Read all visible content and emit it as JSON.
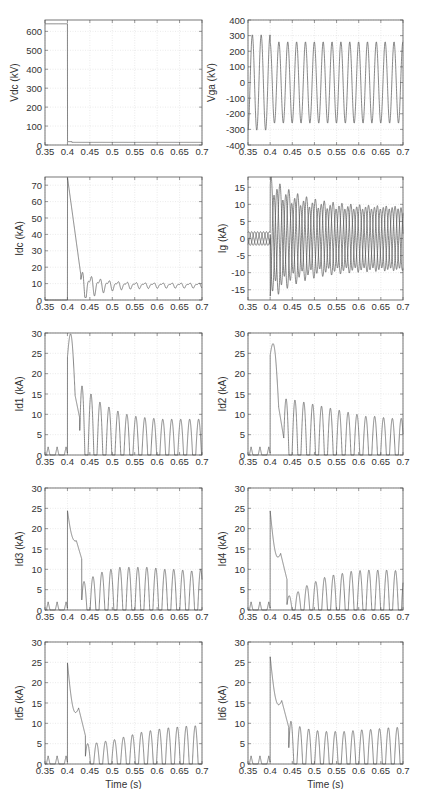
{
  "figure": {
    "layout": "5 rows x 2 columns",
    "xaxis_label": "Time (s)",
    "xticks": [
      "0.35",
      "0.4",
      "0.45",
      "0.5",
      "0.55",
      "0.6",
      "0.65",
      "0.7"
    ],
    "line_color": "#555555",
    "grid_color": "#dddddd"
  },
  "chart_data": [
    {
      "id": "vdc",
      "type": "line",
      "ylabel": "Vdc (kV)",
      "xlim": [
        0.35,
        0.7
      ],
      "ylim": [
        0,
        660
      ],
      "yticks": [
        0,
        100,
        200,
        300,
        400,
        500,
        600
      ],
      "xlabel": "",
      "description": "DC voltage ~640 kV until fault at t=0.4 s, then drops to ~15 kV and stays flat",
      "series": [
        {
          "name": "Vdc",
          "x": [
            0.35,
            0.399,
            0.4,
            0.41,
            0.7
          ],
          "y": [
            640,
            640,
            15,
            15,
            12
          ]
        }
      ]
    },
    {
      "id": "vga",
      "type": "line",
      "ylabel": "Vga (kV)",
      "xlim": [
        0.35,
        0.7
      ],
      "ylim": [
        -400,
        400
      ],
      "yticks": [
        -400,
        -300,
        -200,
        -100,
        0,
        100,
        200,
        300,
        400
      ],
      "xlabel": "",
      "description": "AC phase-a voltage, 50 Hz sinusoid ~±300 kV before 0.4 s, ~±260 kV after",
      "series": [
        {
          "name": "Vga",
          "freq_hz": 50,
          "amp_before": 305,
          "amp_after": 260
        }
      ]
    },
    {
      "id": "idc",
      "type": "line",
      "ylabel": "Idc (kA)",
      "xlim": [
        0.35,
        0.7
      ],
      "ylim": [
        0,
        75
      ],
      "yticks": [
        0,
        10,
        20,
        30,
        40,
        50,
        60,
        70
      ],
      "xlabel": "",
      "description": "DC current ~0 before fault; spikes to ~75 kA at 0.4 s, decays to ~15 kA by 0.43 s, then oscillates settling ~9 kA",
      "series": [
        {
          "name": "Idc",
          "x": [
            0.35,
            0.4,
            0.401,
            0.43,
            0.44,
            0.445,
            0.45,
            0.455,
            0.46,
            0.465,
            0.47,
            0.48,
            0.5,
            0.55,
            0.6,
            0.65,
            0.7
          ],
          "y": [
            0,
            0,
            75,
            14,
            17,
            2,
            16,
            9,
            14,
            2,
            13,
            4,
            8,
            10,
            9,
            9,
            9
          ]
        }
      ]
    },
    {
      "id": "ig",
      "type": "line",
      "ylabel": "Ig (kA)",
      "xlim": [
        0.35,
        0.7
      ],
      "ylim": [
        -18,
        18
      ],
      "yticks": [
        -15,
        -10,
        -5,
        0,
        5,
        10,
        15
      ],
      "xlabel": "",
      "description": "Three-phase grid currents ~±2 kA before 0.4 s; after fault peaks ~±16 kA decaying to ~±9 kA with DC offsets",
      "series": [
        {
          "name": "Ig (3 phases)",
          "amp_before": 2,
          "peak_after": 16.5,
          "steady_after": 9
        }
      ]
    },
    {
      "id": "id1",
      "type": "line",
      "ylabel": "Id1 (kA)",
      "xlim": [
        0.35,
        0.7
      ],
      "ylim": [
        0,
        30
      ],
      "yticks": [
        0,
        5,
        10,
        15,
        20,
        25,
        30
      ],
      "xlabel": "",
      "series": [
        {
          "name": "Id1",
          "pre_peaks": 2,
          "jump": 24,
          "peak": 26.5,
          "dip": 9,
          "pulse_peaks": [
            17,
            15,
            13,
            11.8,
            10.8,
            10,
            9.5,
            9.2,
            9,
            8.8,
            8.8,
            8.8,
            8.8,
            8.8
          ]
        }
      ]
    },
    {
      "id": "id2",
      "type": "line",
      "ylabel": "Id2 (kA)",
      "xlim": [
        0.35,
        0.7
      ],
      "ylim": [
        0,
        30
      ],
      "yticks": [
        0,
        5,
        10,
        15,
        20,
        25,
        30
      ],
      "xlabel": "",
      "series": [
        {
          "name": "Id2",
          "pre_peaks": 2,
          "jump": 24.5,
          "peak": 22.5,
          "dip": 4,
          "pulse_peaks": [
            13.8,
            13.5,
            13,
            12.5,
            12,
            11.5,
            11,
            10.5,
            10,
            9.5,
            9.5,
            9.2,
            9,
            9
          ]
        }
      ]
    },
    {
      "id": "id3",
      "type": "line",
      "ylabel": "Id3 (kA)",
      "xlim": [
        0.35,
        0.7
      ],
      "ylim": [
        0,
        30
      ],
      "yticks": [
        0,
        5,
        10,
        15,
        20,
        25,
        30
      ],
      "xlabel": "",
      "series": [
        {
          "name": "Id3",
          "pre_peaks": 2,
          "jump": 24.5,
          "peak": 16,
          "dip": 12.5,
          "pulse_peaks": [
            7,
            8.2,
            9.3,
            10,
            10.5,
            10.5,
            10.5,
            10.5,
            10.3,
            10,
            10,
            9.8,
            9.6,
            10
          ]
        }
      ]
    },
    {
      "id": "id4",
      "type": "line",
      "ylabel": "Id4 (kA)",
      "xlim": [
        0.35,
        0.7
      ],
      "ylim": [
        0,
        30
      ],
      "yticks": [
        0,
        5,
        10,
        15,
        20,
        25,
        30
      ],
      "xlabel": "",
      "series": [
        {
          "name": "Id4",
          "pre_peaks": 2,
          "jump": 24.5,
          "peak": 11,
          "dip": 7.5,
          "pulse_peaks": [
            3.5,
            4.5,
            6,
            7,
            8,
            8.6,
            9,
            9.5,
            9.7,
            9.8,
            9.8,
            9.8,
            9.7,
            9
          ]
        }
      ]
    },
    {
      "id": "id5",
      "type": "line",
      "ylabel": "Id5 (kA)",
      "xlim": [
        0.35,
        0.7
      ],
      "ylim": [
        0,
        30
      ],
      "yticks": [
        0,
        5,
        10,
        15,
        20,
        25,
        30
      ],
      "xlabel": "Time (s)",
      "series": [
        {
          "name": "Id5",
          "pre_peaks": 2,
          "jump": 25,
          "peak": 10.5,
          "dip": 7,
          "pulse_peaks": [
            5,
            5.2,
            5.6,
            6,
            6.6,
            7.2,
            7.8,
            8.2,
            8.6,
            8.9,
            9.1,
            9.3,
            9.4
          ]
        }
      ]
    },
    {
      "id": "id6",
      "type": "line",
      "ylabel": "Id6 (kA)",
      "xlim": [
        0.35,
        0.7
      ],
      "ylim": [
        0,
        30
      ],
      "yticks": [
        0,
        5,
        10,
        15,
        20,
        25,
        30
      ],
      "xlabel": "Time (s)",
      "series": [
        {
          "name": "Id6",
          "pre_peaks": 2,
          "jump": 26.5,
          "peak": 12.5,
          "dip": 9,
          "pulse_peaks": [
            10.5,
            9.2,
            8.6,
            8.2,
            8,
            8,
            8,
            8.2,
            8.4,
            8.5,
            8.7,
            8.9,
            9
          ]
        }
      ]
    }
  ]
}
